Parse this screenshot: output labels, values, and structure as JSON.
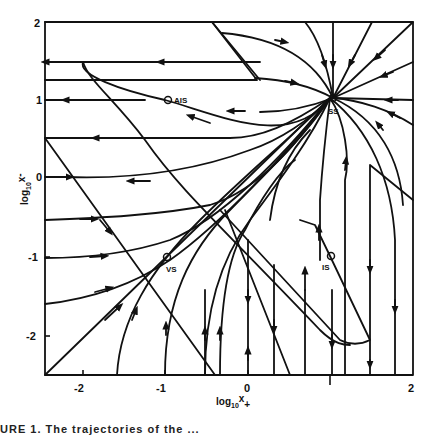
{
  "figure": {
    "x_axis": {
      "label_main": "log",
      "label_sub": "10",
      "label_var": "x",
      "label_suffix": "+",
      "ticks": [
        "-2",
        "-1",
        "0",
        "1",
        "2"
      ]
    },
    "y_axis": {
      "label_main": "log",
      "label_sub": "10",
      "label_var": "x",
      "label_suffix": "-",
      "ticks": [
        "2",
        "1",
        "0",
        "-1",
        "-2"
      ]
    },
    "points": [
      {
        "id": "AIS",
        "label": "AIS",
        "x": -0.98,
        "y": 1.0
      },
      {
        "id": "SS",
        "label": "SS",
        "x": 1.03,
        "y": 1.02
      },
      {
        "id": "VS",
        "label": "VS",
        "x": -0.98,
        "y": -1.0
      },
      {
        "id": "IS",
        "label": "IS",
        "x": 1.0,
        "y": -1.0
      }
    ],
    "caption": "URE 1.  The trajectories of the ..."
  },
  "colors": {
    "line": "#111111",
    "background": "#ffffff"
  }
}
